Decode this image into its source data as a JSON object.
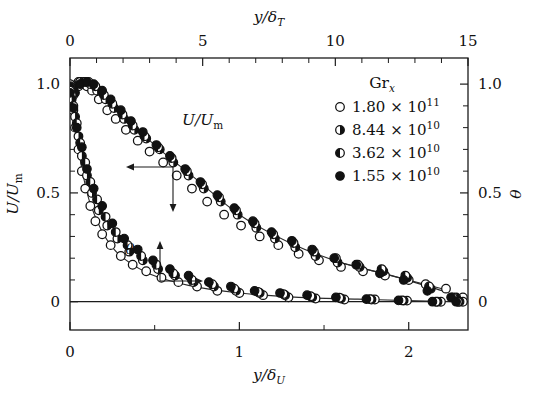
{
  "figure": {
    "background_color": "#ffffff",
    "ink_color": "#1b1b1b"
  },
  "axes": {
    "top": {
      "title_main": "y/",
      "title_symbol": "δ",
      "title_sub": "T",
      "ticklabels": [
        "0",
        "5",
        "10",
        "15"
      ],
      "range": [
        0,
        15
      ],
      "major_step": 5,
      "minor_step": 1
    },
    "bottom": {
      "title_main": "y/",
      "title_symbol": "δ",
      "title_sub": "U",
      "ticklabels": [
        "0",
        "1",
        "2"
      ],
      "range": [
        0,
        2.35
      ],
      "major_step": 1,
      "minor_step": 0.5
    },
    "left": {
      "title_main": "U/U",
      "title_sub": "m",
      "ticklabels": [
        "0",
        "0.5",
        "1.0"
      ],
      "range": [
        -0.13,
        1.12
      ],
      "major_step": 0.5,
      "minor_step": 0.1
    },
    "right": {
      "title_symbol": "θ",
      "ticklabels": [
        "0",
        "0.5",
        "1.0"
      ],
      "range": [
        -0.13,
        1.12
      ],
      "major_step": 0.5,
      "minor_step": 0.1
    }
  },
  "annotations": [
    {
      "name": "velocity-curve-label",
      "text_main": "U/U",
      "text_sub": "m",
      "arrow_directions": [
        "left",
        "down"
      ]
    },
    {
      "name": "temperature-curve-label",
      "text_symbol": "θ",
      "arrow_directions": [
        "up",
        "right"
      ]
    }
  ],
  "legend": {
    "title_main": "Gr",
    "title_sub": "x",
    "entries": [
      {
        "marker": "open-circle",
        "mantissa": "1.80",
        "times": "×",
        "base": "10",
        "exponent": "11"
      },
      {
        "marker": "right-half-filled",
        "mantissa": "8.44",
        "times": "×",
        "base": "10",
        "exponent": "10"
      },
      {
        "marker": "left-half-filled",
        "mantissa": "3.62",
        "times": "×",
        "base": "10",
        "exponent": "10"
      },
      {
        "marker": "filled-circle",
        "mantissa": "1.55",
        "times": "×",
        "base": "10",
        "exponent": "10"
      }
    ]
  },
  "chart_data": {
    "type": "scatter",
    "title": "",
    "xlabel": "y/δ_U  (bottom),  y/δ_T  (top)",
    "ylabel": "U/U_m  (left),  θ  (right)",
    "xlim": [
      0,
      2.35
    ],
    "ylim": [
      -0.13,
      1.12
    ],
    "xlim_top": [
      0,
      15
    ],
    "ylim_right": [
      -0.13,
      1.12
    ],
    "grid": false,
    "legend_position": "top-right",
    "legend_title": "Gr_x",
    "axis_note": "Top axis y/delta_T spans 0-15 and bottom axis y/delta_U spans 0-2.35 over the same frame width; left U/U_m and right theta share the same 0-1.12 vertical mapping.",
    "series": [
      {
        "name": "1.80e11",
        "marker": "open-circle",
        "quantity": "U/U_m",
        "x": [
          0.0,
          0.01,
          0.02,
          0.03,
          0.04,
          0.05,
          0.06,
          0.08,
          0.1,
          0.13,
          0.17,
          0.22,
          0.27,
          0.33,
          0.4,
          0.47,
          0.55,
          0.63,
          0.72,
          0.81,
          0.91,
          1.01,
          1.12,
          1.23,
          1.35,
          1.47,
          1.6,
          1.73,
          1.86,
          2.0,
          2.1,
          2.22,
          2.32
        ],
        "y": [
          0.93,
          0.95,
          0.97,
          0.99,
          1.0,
          1.01,
          1.01,
          1.0,
          0.99,
          0.97,
          0.93,
          0.88,
          0.84,
          0.79,
          0.74,
          0.69,
          0.64,
          0.58,
          0.52,
          0.46,
          0.4,
          0.35,
          0.3,
          0.26,
          0.22,
          0.19,
          0.16,
          0.14,
          0.12,
          0.1,
          0.08,
          0.06,
          0.02
        ]
      },
      {
        "name": "8.44e10",
        "marker": "right-half-filled",
        "quantity": "U/U_m",
        "x": [
          0.0,
          0.02,
          0.04,
          0.06,
          0.09,
          0.12,
          0.16,
          0.21,
          0.26,
          0.32,
          0.38,
          0.45,
          0.53,
          0.61,
          0.7,
          0.79,
          0.89,
          0.99,
          1.1,
          1.21,
          1.33,
          1.45,
          1.58,
          1.71,
          1.85,
          1.99,
          2.13,
          2.28
        ],
        "y": [
          0.92,
          0.96,
          0.99,
          1.01,
          1.01,
          1.0,
          0.97,
          0.93,
          0.89,
          0.84,
          0.79,
          0.75,
          0.7,
          0.64,
          0.58,
          0.52,
          0.46,
          0.4,
          0.34,
          0.29,
          0.25,
          0.21,
          0.18,
          0.16,
          0.14,
          0.11,
          0.06,
          0.02
        ]
      },
      {
        "name": "3.62e10",
        "marker": "left-half-filled",
        "quantity": "U/U_m",
        "x": [
          0.0,
          0.02,
          0.05,
          0.08,
          0.11,
          0.15,
          0.2,
          0.25,
          0.31,
          0.37,
          0.44,
          0.52,
          0.6,
          0.69,
          0.78,
          0.88,
          0.98,
          1.09,
          1.2,
          1.32,
          1.44,
          1.57,
          1.7,
          1.84,
          1.98,
          2.12,
          2.26
        ],
        "y": [
          0.9,
          0.95,
          0.99,
          1.01,
          1.01,
          0.99,
          0.95,
          0.91,
          0.86,
          0.81,
          0.76,
          0.71,
          0.66,
          0.6,
          0.54,
          0.48,
          0.42,
          0.36,
          0.31,
          0.27,
          0.23,
          0.2,
          0.17,
          0.15,
          0.12,
          0.07,
          0.02
        ]
      },
      {
        "name": "1.55e10",
        "marker": "filled-circle",
        "quantity": "U/U_m",
        "x": [
          0.0,
          0.03,
          0.06,
          0.1,
          0.14,
          0.19,
          0.24,
          0.3,
          0.36,
          0.43,
          0.51,
          0.59,
          0.68,
          0.77,
          0.87,
          0.97,
          1.08,
          1.19,
          1.31,
          1.43,
          1.56,
          1.69,
          1.83,
          1.97,
          2.11,
          2.25
        ],
        "y": [
          0.9,
          0.96,
          1.0,
          1.01,
          1.0,
          0.97,
          0.93,
          0.88,
          0.83,
          0.78,
          0.72,
          0.67,
          0.61,
          0.55,
          0.49,
          0.43,
          0.37,
          0.32,
          0.28,
          0.24,
          0.2,
          0.17,
          0.13,
          0.1,
          0.05,
          0.02
        ]
      },
      {
        "name": "1.80e11",
        "marker": "open-circle",
        "quantity": "theta",
        "x": [
          0.0,
          0.01,
          0.02,
          0.03,
          0.05,
          0.07,
          0.09,
          0.12,
          0.15,
          0.19,
          0.24,
          0.3,
          0.37,
          0.45,
          0.54,
          0.64,
          0.75,
          0.87,
          1.0,
          1.14,
          1.29,
          1.45,
          1.62,
          1.8,
          1.99,
          2.19,
          2.32
        ],
        "y": [
          1.0,
          0.95,
          0.88,
          0.8,
          0.7,
          0.6,
          0.52,
          0.44,
          0.37,
          0.31,
          0.26,
          0.21,
          0.17,
          0.14,
          0.11,
          0.09,
          0.07,
          0.05,
          0.04,
          0.03,
          0.02,
          0.015,
          0.01,
          0.01,
          0.005,
          0.0,
          0.0
        ]
      },
      {
        "name": "8.44e10",
        "marker": "right-half-filled",
        "quantity": "theta",
        "x": [
          0.0,
          0.01,
          0.03,
          0.05,
          0.07,
          0.1,
          0.13,
          0.17,
          0.22,
          0.28,
          0.35,
          0.43,
          0.52,
          0.62,
          0.73,
          0.85,
          0.98,
          1.12,
          1.27,
          1.43,
          1.6,
          1.78,
          1.97,
          2.17,
          2.3
        ],
        "y": [
          0.99,
          0.93,
          0.85,
          0.76,
          0.67,
          0.58,
          0.5,
          0.42,
          0.35,
          0.29,
          0.23,
          0.19,
          0.15,
          0.12,
          0.09,
          0.07,
          0.05,
          0.04,
          0.03,
          0.02,
          0.015,
          0.01,
          0.005,
          0.0,
          0.0
        ]
      },
      {
        "name": "3.62e10",
        "marker": "left-half-filled",
        "quantity": "theta",
        "x": [
          0.0,
          0.02,
          0.04,
          0.06,
          0.09,
          0.12,
          0.16,
          0.21,
          0.27,
          0.34,
          0.42,
          0.51,
          0.61,
          0.72,
          0.84,
          0.97,
          1.11,
          1.26,
          1.42,
          1.59,
          1.77,
          1.96,
          2.16,
          2.29
        ],
        "y": [
          0.97,
          0.9,
          0.82,
          0.73,
          0.64,
          0.55,
          0.47,
          0.39,
          0.32,
          0.26,
          0.21,
          0.17,
          0.13,
          0.1,
          0.08,
          0.06,
          0.045,
          0.035,
          0.025,
          0.018,
          0.012,
          0.006,
          0.0,
          0.0
        ]
      },
      {
        "name": "1.55e10",
        "marker": "filled-circle",
        "quantity": "theta",
        "x": [
          0.0,
          0.02,
          0.04,
          0.07,
          0.1,
          0.14,
          0.19,
          0.25,
          0.32,
          0.4,
          0.49,
          0.59,
          0.7,
          0.82,
          0.95,
          1.09,
          1.24,
          1.4,
          1.57,
          1.75,
          1.94,
          2.14,
          2.28
        ],
        "y": [
          0.96,
          0.89,
          0.8,
          0.71,
          0.61,
          0.52,
          0.44,
          0.36,
          0.29,
          0.24,
          0.19,
          0.15,
          0.12,
          0.09,
          0.07,
          0.05,
          0.04,
          0.03,
          0.02,
          0.012,
          0.006,
          0.0,
          0.0
        ]
      }
    ],
    "fit_lines": [
      {
        "name": "velocity-fit",
        "x": [
          0.0,
          0.06,
          0.15,
          0.3,
          0.5,
          0.75,
          1.0,
          1.3,
          1.6,
          1.9,
          2.2
        ],
        "y": [
          0.92,
          1.01,
          0.99,
          0.87,
          0.72,
          0.56,
          0.4,
          0.27,
          0.18,
          0.12,
          0.05
        ]
      },
      {
        "name": "temperature-fit",
        "x": [
          0.0,
          0.05,
          0.12,
          0.25,
          0.45,
          0.7,
          1.0,
          1.35,
          1.7,
          2.05,
          2.32
        ],
        "y": [
          1.0,
          0.7,
          0.45,
          0.25,
          0.135,
          0.075,
          0.04,
          0.02,
          0.012,
          0.004,
          0.0
        ]
      }
    ]
  }
}
